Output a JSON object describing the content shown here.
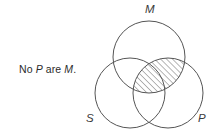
{
  "figure": {
    "type": "venn-diagram",
    "caption": {
      "prefix": "No ",
      "term1": "P",
      "middle": " are ",
      "term2": "M",
      "suffix": "."
    },
    "caption_full": "No P are M.",
    "stroke_color": "#555555",
    "hatch_color": "#777777",
    "background_color": "#ffffff",
    "circles": [
      {
        "id": "M",
        "label": "M",
        "cx": 149,
        "cy": 57,
        "r": 36
      },
      {
        "id": "S",
        "label": "S",
        "cx": 130,
        "cy": 93,
        "r": 35
      },
      {
        "id": "P",
        "label": "P",
        "cx": 168,
        "cy": 93,
        "r": 35
      }
    ],
    "shaded_region": {
      "id": "M-and-P",
      "description": "intersection of M and P",
      "fill": "diagonal-hatch",
      "hatch_angle_degrees": 45,
      "hatch_spacing_px": 3
    },
    "labels": {
      "m": "M",
      "s": "S",
      "p": "P"
    }
  }
}
